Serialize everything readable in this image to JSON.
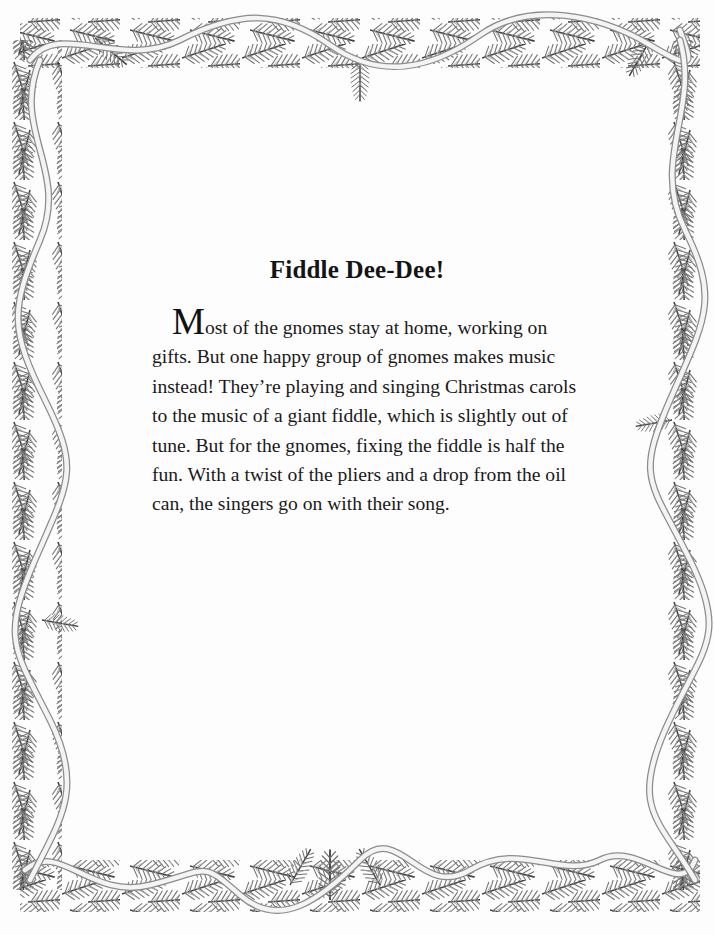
{
  "page": {
    "title": "Fiddle Dee-Dee!",
    "drop_cap": "M",
    "lines": [
      "ost of the gnomes stay at home, working on",
      "gifts. But one happy group of gnomes makes music",
      "instead! They’re playing and singing Christmas carols",
      "to the music of a giant fiddle, which is slightly out of",
      "tune. But for the gnomes, fixing the fiddle is half the",
      "fun. With a twist of the pliers and a drop from the oil",
      "can, the singers go on with their song."
    ]
  },
  "decoration": {
    "border": "pine-garland-with-ribbon",
    "colors": {
      "needle_dark": "#3a3a3a",
      "needle_mid": "#7a7a7a",
      "needle_light": "#b5b5b5",
      "ribbon": "#f4f4f4",
      "ribbon_edge": "#8c8c8c"
    }
  }
}
